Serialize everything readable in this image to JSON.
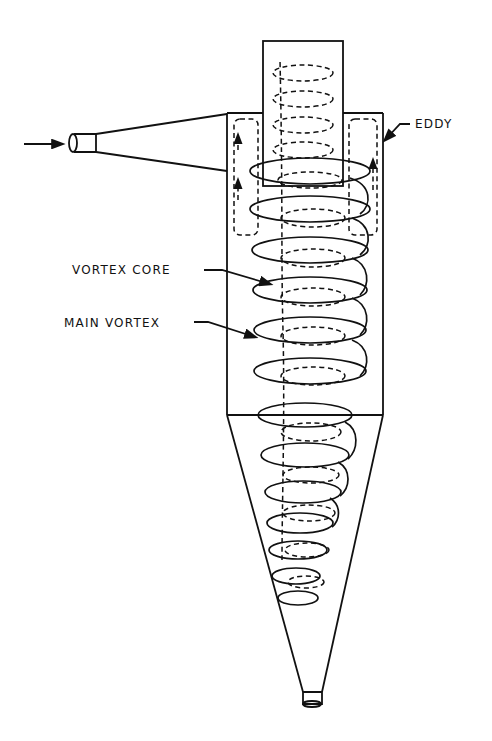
{
  "diagram": {
    "labels": {
      "eddy": "EDDY",
      "vortex_core": "VORTEX CORE",
      "main_vortex": "MAIN VORTEX"
    },
    "components": [
      "inlet",
      "vortex-finder",
      "cylinder-body",
      "cone",
      "dust-outlet"
    ],
    "flows": [
      {
        "name": "main-vortex",
        "style": "solid",
        "direction": "downward spiral"
      },
      {
        "name": "vortex-core",
        "style": "dashed",
        "direction": "upward spiral"
      },
      {
        "name": "eddy",
        "style": "dashed",
        "direction": "short-circuit loop near top"
      }
    ],
    "colors": {
      "line": "#111111",
      "background": "#ffffff"
    }
  }
}
